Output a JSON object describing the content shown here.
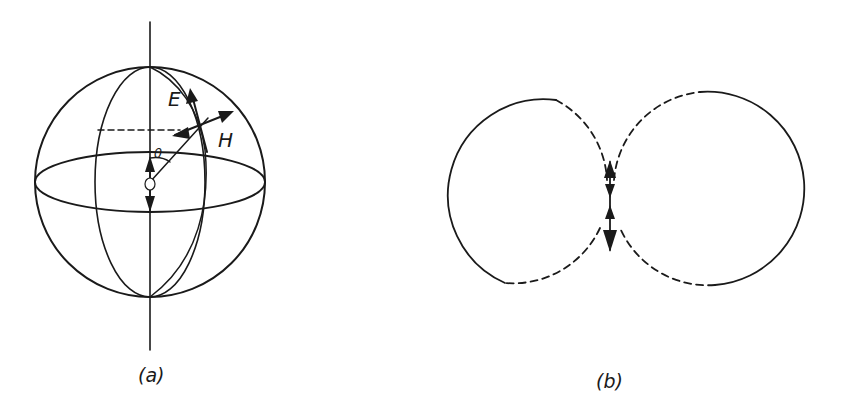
{
  "figure": {
    "panels": [
      {
        "id": "a",
        "caption": "(a)",
        "description": "Sphere with polar axis, meridians, equator, central dipole, radial line at angle theta, and E/H field vectors",
        "labels": {
          "electric_field": "E",
          "magnetic_field": "H",
          "angle": "θ"
        }
      },
      {
        "id": "b",
        "caption": "(b)",
        "description": "Radiation pattern: two tangent circles (figure-eight) with solid and dashed segments, vertical dipole arrows at junction"
      }
    ],
    "colors": {
      "ink": "#1a1a1a",
      "background": "#ffffff"
    }
  }
}
